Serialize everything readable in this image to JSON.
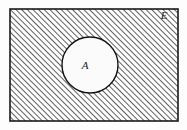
{
  "figure": {
    "kind": "venn-diagram",
    "caption": "",
    "width": 187,
    "height": 130,
    "background_color": "#fdfdfd"
  },
  "universal_set": {
    "label": "E",
    "label_name": "universal-set-label",
    "shape": "rectangle",
    "x": 10,
    "y": 9,
    "width": 168,
    "height": 112,
    "border_color": "#1a1a1a",
    "border_width": 1.6,
    "fill_color": "#ffffff"
  },
  "shading": {
    "region_label": "complement-of-A",
    "style": "diagonal-hatch",
    "angle_degrees": 45,
    "direction": "bottom-left-to-top-right",
    "spacing_px": 4,
    "line_width_px": 1.5,
    "line_color": "#2b2b2b"
  },
  "subset": {
    "label": "A",
    "label_name": "set-a-label",
    "shape": "circle",
    "cx": 90,
    "cy": 65,
    "r": 28,
    "border_color": "#141414",
    "border_width": 1.4,
    "fill_color": "#fbfbfb",
    "label_x": 85,
    "label_y": 69
  },
  "labels": {
    "universe_x": 164,
    "universe_y": 19
  }
}
